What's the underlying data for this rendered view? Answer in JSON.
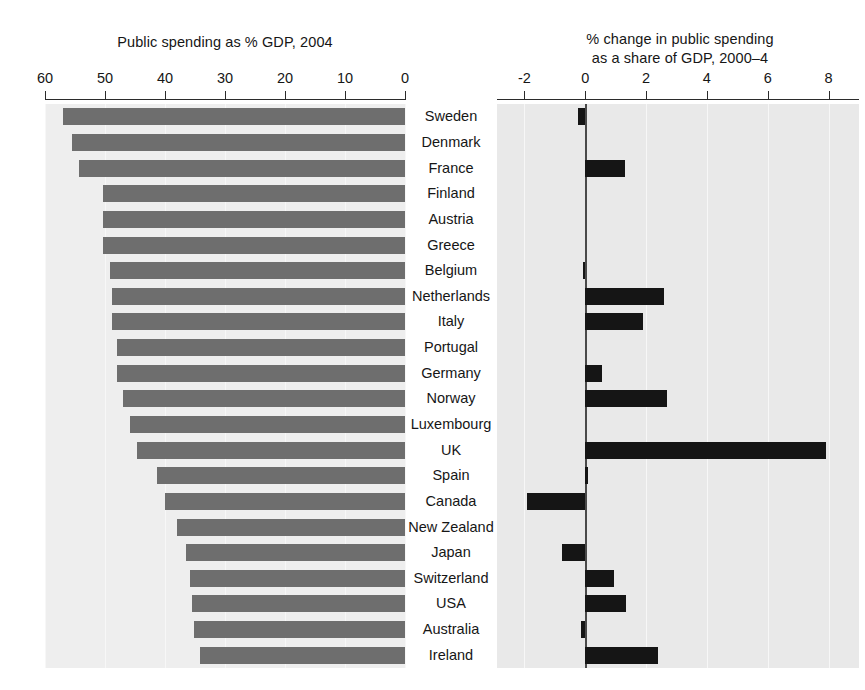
{
  "chart_data": {
    "type": "bar",
    "orientation": "horizontal",
    "title": "",
    "panels": [
      {
        "id": "left",
        "title": "Public spending as % GDP, 2004",
        "xlabel": "",
        "ylabel": "",
        "xlim": [
          60,
          0
        ],
        "reversed": true,
        "ticks": [
          60,
          50,
          40,
          30,
          20,
          10,
          0
        ],
        "tick_labels": [
          "60",
          "50",
          "40",
          "30",
          "20",
          "10",
          "0"
        ],
        "grid": true,
        "bar_color": "#6e6e6e",
        "values": [
          57.0,
          55.5,
          54.3,
          50.3,
          50.3,
          50.3,
          49.2,
          48.8,
          48.8,
          48.0,
          48.0,
          47.0,
          45.8,
          44.6,
          41.3,
          40.0,
          38.0,
          36.5,
          35.8,
          35.5,
          35.2,
          34.2
        ]
      },
      {
        "id": "right",
        "title": "% change in public spending\nas a share of GDP, 2000–4",
        "xlabel": "",
        "ylabel": "",
        "xlim": [
          -2.9,
          9.0
        ],
        "reversed": false,
        "ticks": [
          -2,
          0,
          2,
          4,
          6,
          8
        ],
        "tick_labels": [
          "-2",
          "0",
          "2",
          "4",
          "6",
          "8"
        ],
        "grid": true,
        "bar_color": "#151515",
        "values": [
          -0.25,
          0.0,
          1.3,
          0.0,
          0.0,
          0.0,
          -0.07,
          2.6,
          1.9,
          0.0,
          0.55,
          2.7,
          0.0,
          7.9,
          0.08,
          -1.9,
          0.0,
          -0.75,
          0.95,
          1.35,
          -0.15,
          2.4
        ]
      }
    ],
    "categories": [
      "Sweden",
      "Denmark",
      "France",
      "Finland",
      "Austria",
      "Greece",
      "Belgium",
      "Netherlands",
      "Italy",
      "Portugal",
      "Germany",
      "Norway",
      "Luxembourg",
      "UK",
      "Spain",
      "Canada",
      "New  Zealand",
      "Japan",
      "Switzerland",
      "USA",
      "Australia",
      "Ireland"
    ],
    "category_label_rows": [
      "Sweden",
      "Denmark",
      "France",
      "Finland",
      "Austria",
      "Greece",
      "Belgium",
      "Netherlands",
      "Italy",
      "Portugal",
      "Germany",
      "Norway",
      "Luxembourg",
      "UK",
      "Spain",
      "Canada",
      "New  Zealand",
      "Japan",
      "Switzerland",
      "USA",
      "Australia",
      "Ireland"
    ],
    "colors": {
      "left_bar": "#6e6e6e",
      "right_bar": "#151515",
      "plot_background": "#ebebeb",
      "axis": "#2b2b2b",
      "gridline": "#f7f7f7",
      "zero_line": "#4a4a4a",
      "text": "#161616"
    }
  }
}
